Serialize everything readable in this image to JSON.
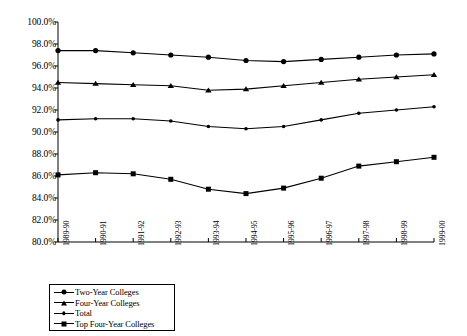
{
  "chart_data": {
    "type": "line",
    "title": "",
    "xlabel": "",
    "ylabel": "",
    "ylim": [
      80.0,
      100.0
    ],
    "ytick_step": 2.0,
    "grid": false,
    "legend_position": "below-left",
    "yticks": [
      "100.0%",
      "98.0%",
      "96.0%",
      "94.0%",
      "92.0%",
      "90.0%",
      "88.0%",
      "86.0%",
      "84.0%",
      "82.0%",
      "80.0%"
    ],
    "ytick_values": [
      100.0,
      98.0,
      96.0,
      94.0,
      92.0,
      90.0,
      88.0,
      86.0,
      84.0,
      82.0,
      80.0
    ],
    "categories": [
      "1989-90",
      "1990-91",
      "1991-92",
      "1992-93",
      "1993-94",
      "1994-95",
      "1995-96",
      "1996-97",
      "1997-98",
      "1998-99",
      "1999-00"
    ],
    "series": [
      {
        "name": "Two-Year Colleges",
        "marker": "circle",
        "values": [
          97.4,
          97.4,
          97.2,
          97.0,
          96.8,
          96.5,
          96.4,
          96.6,
          96.8,
          97.0,
          97.1
        ]
      },
      {
        "name": "Four-Year Colleges",
        "marker": "triangle",
        "values": [
          94.5,
          94.4,
          94.3,
          94.2,
          93.8,
          93.9,
          94.2,
          94.5,
          94.8,
          95.0,
          95.2
        ]
      },
      {
        "name": "Total",
        "marker": "dot",
        "values": [
          91.1,
          91.2,
          91.2,
          91.0,
          90.5,
          90.3,
          90.5,
          91.1,
          91.7,
          92.0,
          92.3
        ]
      },
      {
        "name": "Top Four-Year Colleges",
        "marker": "square",
        "values": [
          86.1,
          86.3,
          86.2,
          85.7,
          84.8,
          84.4,
          84.9,
          85.8,
          86.9,
          87.3,
          87.7
        ]
      }
    ],
    "colors": {
      "line": "#000000",
      "axis": "#000000",
      "background": "#ffffff"
    }
  }
}
